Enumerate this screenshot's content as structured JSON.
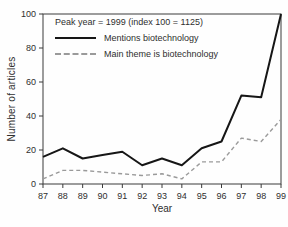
{
  "chart_data": {
    "type": "line",
    "note": "Peak year = 1999 (index 100 = 1125)",
    "xlabel": "Year",
    "ylabel": "Number of articles",
    "categories": [
      "87",
      "88",
      "89",
      "90",
      "91",
      "92",
      "93",
      "94",
      "95",
      "96",
      "97",
      "98",
      "99"
    ],
    "series": [
      {
        "name": "Mentions biotechnology",
        "style": "solid",
        "color": "#161616",
        "stroke_width": 2,
        "values": [
          16,
          21,
          15,
          17,
          19,
          11,
          15,
          11,
          21,
          25,
          52,
          51,
          100
        ]
      },
      {
        "name": "Main theme is biotechnology",
        "style": "dashed",
        "color": "#9a9a9a",
        "stroke_width": 1.4,
        "dash": "4 3",
        "values": [
          3,
          8,
          8,
          7,
          6,
          5,
          6,
          3,
          13,
          13,
          27,
          25,
          38
        ]
      }
    ],
    "ylim": [
      0,
      100
    ],
    "yticks": [
      0,
      20,
      40,
      60,
      80,
      100
    ],
    "grid": "off",
    "legend_position": "top-left-inside",
    "frame": "full-box",
    "frame_color": "#3a3a3a"
  }
}
